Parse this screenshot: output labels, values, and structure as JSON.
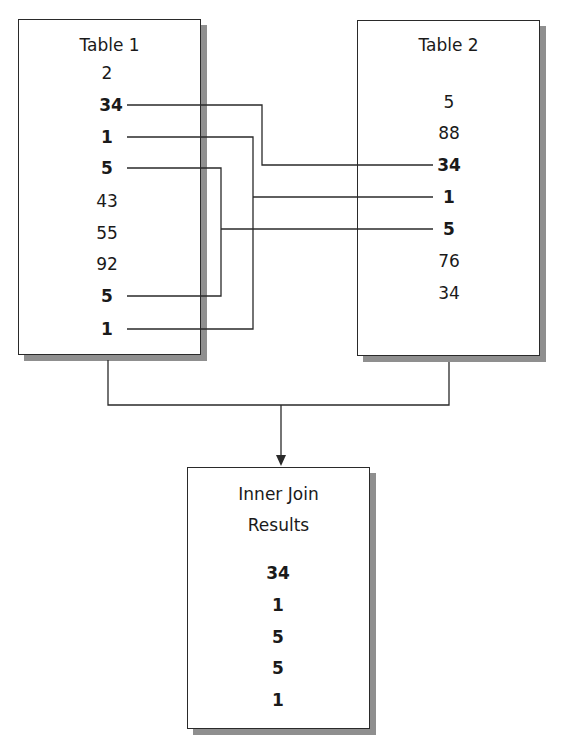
{
  "table1": {
    "title": "Table 1",
    "rows": [
      "2",
      "34",
      "1",
      "5",
      "43",
      "55",
      "92",
      "5",
      "1"
    ]
  },
  "table2": {
    "title": "Table 2",
    "rows": [
      "5",
      "88",
      "34",
      "1",
      "5",
      "76",
      "34"
    ]
  },
  "result": {
    "title_line1": "Inner Join",
    "title_line2": "Results",
    "rows": [
      "34",
      "1",
      "5",
      "5",
      "1"
    ]
  },
  "colors": {
    "line": "#2a2a2a",
    "shadow": "#8f8f8f",
    "background": "#ffffff"
  }
}
